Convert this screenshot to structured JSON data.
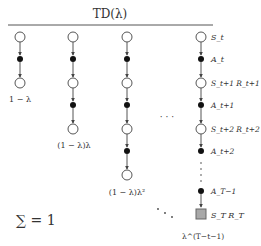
{
  "title": "TD(λ)",
  "columns": [
    {
      "weight": "1 − λ"
    },
    {
      "weight": "(1 − λ)λ"
    },
    {
      "weight": "(1 − λ)λ²"
    },
    {
      "weight": "λ^(T−t−1)"
    }
  ],
  "last_column_labels": {
    "s0": "S_t",
    "a0": "A_t",
    "s1": "S_t+1  R_t+1",
    "a1": "A_t+1",
    "s2": "S_t+2  R_t+2",
    "a2": "A_t+2",
    "aT": "A_T−1",
    "sT": "S_T  R_T"
  },
  "ellipsis": "· · ·",
  "sum_label": "∑ = 1",
  "colors": {
    "line": "#555555",
    "state_fill": "#ffffff",
    "action_fill": "#111111",
    "terminal_fill": "#a8a8a8"
  }
}
